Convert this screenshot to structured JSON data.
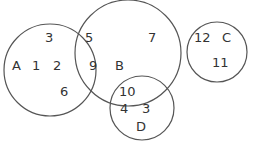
{
  "diagram": {
    "type": "venn",
    "stroke_color": "#555555",
    "text_color": "#333333",
    "sets": [
      {
        "name": "A",
        "cx": 50,
        "cy": 70,
        "r": 46
      },
      {
        "name": "B",
        "cx": 128,
        "cy": 53,
        "r": 53
      },
      {
        "name": "C",
        "cx": 217,
        "cy": 52,
        "r": 30
      },
      {
        "name": "D",
        "cx": 142,
        "cy": 108,
        "r": 32
      }
    ],
    "labels": {
      "A": "A",
      "B": "B",
      "C": "C",
      "D": "D"
    },
    "elements": {
      "e3_in_A": "3",
      "e1": "1",
      "e2": "2",
      "e6": "6",
      "e5": "5",
      "e9": "9",
      "e7": "7",
      "e10": "10",
      "e4": "4",
      "e3_in_D": "3",
      "e12": "12",
      "e11": "11"
    },
    "regions": {
      "A_only": [
        "1",
        "2",
        "3",
        "6"
      ],
      "A_and_B": [
        "5",
        "9"
      ],
      "B_only": [
        "7"
      ],
      "B_and_D": [
        "10"
      ],
      "D_only": [
        "3",
        "4"
      ],
      "C_only": [
        "11",
        "12"
      ]
    }
  }
}
